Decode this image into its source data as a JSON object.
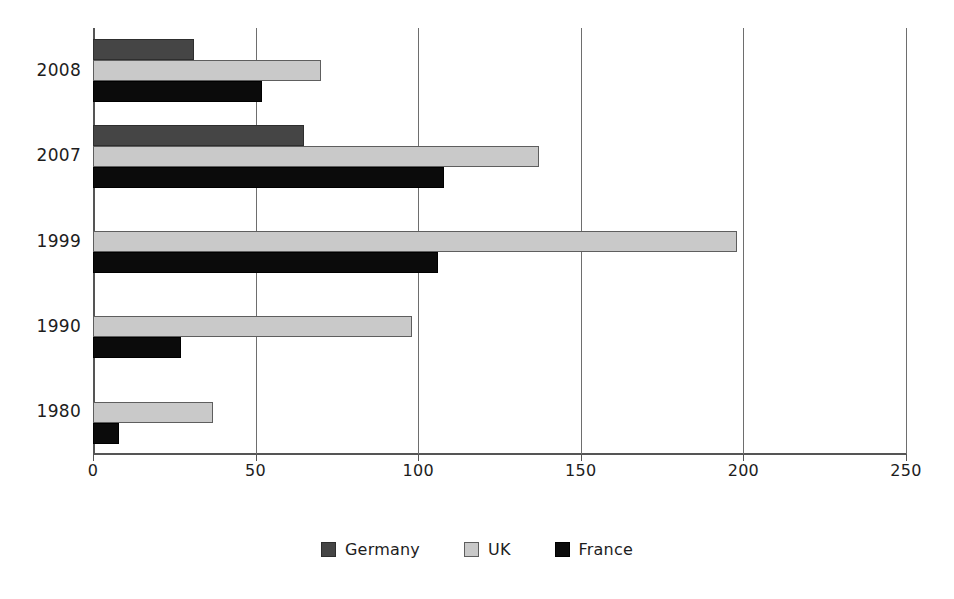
{
  "chart_data": {
    "type": "bar",
    "orientation": "horizontal",
    "title": "",
    "subtitle": "",
    "xlabel": "",
    "ylabel": "",
    "categories": [
      "2008",
      "2007",
      "1999",
      "1990",
      "1980"
    ],
    "series": [
      {
        "name": "Germany",
        "color": "#454545",
        "values": [
          31,
          65,
          0,
          0,
          0
        ]
      },
      {
        "name": "UK",
        "color": "#c9c9c9",
        "values": [
          70,
          137,
          198,
          98,
          37
        ]
      },
      {
        "name": "France",
        "color": "#0b0b0b",
        "values": [
          52,
          108,
          106,
          27,
          8
        ]
      }
    ],
    "xlim": [
      0,
      250
    ],
    "xticks": [
      0,
      50,
      100,
      150,
      200,
      250
    ],
    "xtick_labels": [
      "0",
      "50",
      "100",
      "150",
      "200",
      "250"
    ],
    "grid": {
      "vertical": true,
      "horizontal": false
    },
    "legend": {
      "position": "bottom",
      "entries": [
        "Germany",
        "UK",
        "France"
      ]
    },
    "annotations": []
  },
  "legend": {
    "items": [
      {
        "label": "Germany",
        "key": "germany"
      },
      {
        "label": "UK",
        "key": "uk"
      },
      {
        "label": "France",
        "key": "france"
      }
    ]
  },
  "axis": {
    "x_tick_labels": [
      "0",
      "50",
      "100",
      "150",
      "200",
      "250"
    ],
    "y_tick_labels": [
      "2008",
      "2007",
      "1999",
      "1990",
      "1980"
    ]
  }
}
